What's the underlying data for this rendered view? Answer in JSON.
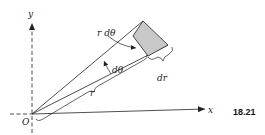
{
  "figure": {
    "number": "18.21",
    "labels": {
      "y_axis": "y",
      "x_axis": "x",
      "origin": "O",
      "arc_length": "r dθ",
      "angle": "dθ",
      "radial_increment": "dr",
      "radius": "r"
    },
    "colors": {
      "line": "#222222",
      "shaded_element": "#c8c8c8"
    }
  }
}
